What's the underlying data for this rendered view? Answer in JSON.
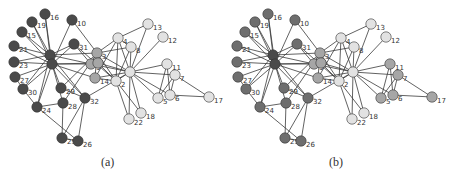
{
  "figure": {
    "panels": [
      {
        "id": "a",
        "caption": "(a)",
        "offset_x": 0
      },
      {
        "id": "b",
        "caption": "(b)",
        "offset_x": 223
      }
    ]
  },
  "colors": {
    "dark": "#4a4a4a",
    "mid_dark": "#6e6e6e",
    "mid": "#a6a6a6",
    "light": "#e2e2e2",
    "edge": "#3a3a3a"
  },
  "graph": {
    "nodes": [
      {
        "id": 1,
        "x": 130,
        "y": 72,
        "label": "",
        "a": "light",
        "b": "light"
      },
      {
        "id": 2,
        "x": 116,
        "y": 81,
        "label": "2",
        "a": "light",
        "b": "light"
      },
      {
        "id": 3,
        "x": 97,
        "y": 53,
        "label": "3",
        "a": "mid",
        "b": "mid"
      },
      {
        "id": 4,
        "x": 118,
        "y": 38,
        "label": "4",
        "a": "light",
        "b": "light"
      },
      {
        "id": 5,
        "x": 158,
        "y": 98,
        "label": "5",
        "a": "light",
        "b": "mid"
      },
      {
        "id": 6,
        "x": 170,
        "y": 95,
        "label": "6",
        "a": "light",
        "b": "mid"
      },
      {
        "id": 7,
        "x": 175,
        "y": 75,
        "label": "7",
        "a": "light",
        "b": "mid"
      },
      {
        "id": 8,
        "x": 131,
        "y": 47,
        "label": "8",
        "a": "light",
        "b": "light"
      },
      {
        "id": 9,
        "x": 91,
        "y": 64,
        "label": "9",
        "a": "mid",
        "b": "mid"
      },
      {
        "id": 10,
        "x": 72,
        "y": 20,
        "label": "10",
        "a": "dark",
        "b": "mid_dark"
      },
      {
        "id": 11,
        "x": 167,
        "y": 64,
        "label": "11",
        "a": "light",
        "b": "mid"
      },
      {
        "id": 12,
        "x": 163,
        "y": 37,
        "label": "12",
        "a": "light",
        "b": "light"
      },
      {
        "id": 13,
        "x": 148,
        "y": 24,
        "label": "13",
        "a": "light",
        "b": "light"
      },
      {
        "id": 14,
        "x": 95,
        "y": 78,
        "label": "14",
        "a": "mid",
        "b": "mid"
      },
      {
        "id": 15,
        "x": 22,
        "y": 32,
        "label": "15",
        "a": "dark",
        "b": "mid_dark"
      },
      {
        "id": 16,
        "x": 45,
        "y": 14,
        "label": "16",
        "a": "dark",
        "b": "mid_dark"
      },
      {
        "id": 17,
        "x": 209,
        "y": 97,
        "label": "17",
        "a": "light",
        "b": "mid"
      },
      {
        "id": 18,
        "x": 141,
        "y": 113,
        "label": "18",
        "a": "light",
        "b": "light"
      },
      {
        "id": 19,
        "x": 32,
        "y": 22,
        "label": "19",
        "a": "dark",
        "b": "mid_dark"
      },
      {
        "id": 20,
        "x": 98,
        "y": 63,
        "label": "",
        "a": "mid",
        "b": "mid"
      },
      {
        "id": 21,
        "x": 14,
        "y": 46,
        "label": "21",
        "a": "dark",
        "b": "mid_dark"
      },
      {
        "id": 22,
        "x": 129,
        "y": 119,
        "label": "22",
        "a": "light",
        "b": "light"
      },
      {
        "id": 23,
        "x": 14,
        "y": 62,
        "label": "23",
        "a": "dark",
        "b": "mid_dark"
      },
      {
        "id": 24,
        "x": 37,
        "y": 107,
        "label": "24",
        "a": "dark",
        "b": "mid_dark"
      },
      {
        "id": 25,
        "x": 62,
        "y": 138,
        "label": "25",
        "a": "dark",
        "b": "mid_dark"
      },
      {
        "id": 26,
        "x": 78,
        "y": 141,
        "label": "26",
        "a": "dark",
        "b": "mid_dark"
      },
      {
        "id": 27,
        "x": 15,
        "y": 77,
        "label": "27",
        "a": "dark",
        "b": "mid_dark"
      },
      {
        "id": 28,
        "x": 63,
        "y": 103,
        "label": "28",
        "a": "dark",
        "b": "mid_dark"
      },
      {
        "id": 29,
        "x": 61,
        "y": 88,
        "label": "29",
        "a": "dark",
        "b": "mid_dark"
      },
      {
        "id": 30,
        "x": 23,
        "y": 89,
        "label": "30",
        "a": "dark",
        "b": "mid_dark"
      },
      {
        "id": 31,
        "x": 74,
        "y": 44,
        "label": "31",
        "a": "dark",
        "b": "mid_dark"
      },
      {
        "id": 32,
        "x": 85,
        "y": 98,
        "label": "32",
        "a": "dark",
        "b": "mid_dark"
      },
      {
        "id": 33,
        "x": 50,
        "y": 55,
        "label": "",
        "a": "dark",
        "b": "dark"
      },
      {
        "id": 34,
        "x": 52,
        "y": 64,
        "label": "",
        "a": "dark",
        "b": "dark"
      }
    ],
    "edges": [
      [
        1,
        2
      ],
      [
        1,
        3
      ],
      [
        1,
        4
      ],
      [
        1,
        5
      ],
      [
        1,
        6
      ],
      [
        1,
        7
      ],
      [
        1,
        8
      ],
      [
        1,
        9
      ],
      [
        1,
        11
      ],
      [
        1,
        12
      ],
      [
        1,
        13
      ],
      [
        1,
        14
      ],
      [
        1,
        18
      ],
      [
        1,
        20
      ],
      [
        1,
        22
      ],
      [
        1,
        32
      ],
      [
        2,
        3
      ],
      [
        2,
        4
      ],
      [
        2,
        8
      ],
      [
        2,
        14
      ],
      [
        2,
        18
      ],
      [
        2,
        20
      ],
      [
        2,
        22
      ],
      [
        2,
        31
      ],
      [
        3,
        4
      ],
      [
        3,
        8
      ],
      [
        3,
        9
      ],
      [
        3,
        10
      ],
      [
        3,
        14
      ],
      [
        3,
        28
      ],
      [
        3,
        29
      ],
      [
        3,
        33
      ],
      [
        4,
        8
      ],
      [
        4,
        13
      ],
      [
        4,
        14
      ],
      [
        5,
        7
      ],
      [
        5,
        11
      ],
      [
        6,
        7
      ],
      [
        6,
        11
      ],
      [
        6,
        17
      ],
      [
        7,
        17
      ],
      [
        9,
        31
      ],
      [
        9,
        33
      ],
      [
        9,
        34
      ],
      [
        10,
        34
      ],
      [
        14,
        34
      ],
      [
        15,
        33
      ],
      [
        15,
        34
      ],
      [
        16,
        33
      ],
      [
        16,
        34
      ],
      [
        19,
        33
      ],
      [
        19,
        34
      ],
      [
        20,
        34
      ],
      [
        21,
        33
      ],
      [
        21,
        34
      ],
      [
        23,
        33
      ],
      [
        23,
        34
      ],
      [
        24,
        26
      ],
      [
        24,
        28
      ],
      [
        24,
        30
      ],
      [
        24,
        33
      ],
      [
        24,
        34
      ],
      [
        25,
        26
      ],
      [
        25,
        28
      ],
      [
        25,
        32
      ],
      [
        26,
        32
      ],
      [
        27,
        30
      ],
      [
        27,
        34
      ],
      [
        28,
        34
      ],
      [
        29,
        32
      ],
      [
        29,
        34
      ],
      [
        30,
        33
      ],
      [
        30,
        34
      ],
      [
        31,
        33
      ],
      [
        31,
        34
      ],
      [
        32,
        33
      ],
      [
        32,
        34
      ],
      [
        33,
        34
      ]
    ]
  }
}
